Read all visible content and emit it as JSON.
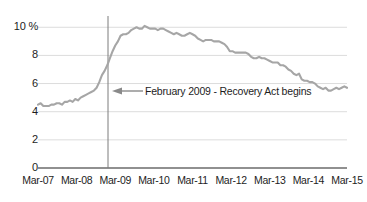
{
  "chart_data": {
    "type": "line",
    "title": "",
    "subtitle": "",
    "xlabel": "",
    "ylabel": "",
    "grid": true,
    "legend": "none",
    "ylim": [
      0,
      10.8
    ],
    "yticks": [
      0,
      2,
      4,
      6,
      8,
      10
    ],
    "ytick_labels": [
      "0",
      "2",
      "4",
      "6",
      "8",
      "10 %"
    ],
    "xtick_labels": [
      "Mar-07",
      "Mar-08",
      "Mar-09",
      "Mar-10",
      "Mar-11",
      "Mar-12",
      "Mar-13",
      "Mar-14",
      "Mar-15"
    ],
    "x_start": "Mar-07",
    "x_end": "Mar-15",
    "line_color": "#a6a6a6",
    "axis_color": "#6b6b6b",
    "grid_color": "#dcdcdc",
    "text_color": "#1d1d1d",
    "series": [
      {
        "name": "Unemployment rate",
        "values": [
          4.5,
          4.6,
          4.4,
          4.4,
          4.4,
          4.5,
          4.5,
          4.6,
          4.6,
          4.5,
          4.7,
          4.7,
          4.8,
          4.7,
          4.9,
          4.8,
          5.0,
          5.1,
          5.2,
          5.3,
          5.4,
          5.5,
          5.7,
          6.1,
          6.6,
          6.9,
          7.3,
          7.8,
          8.3,
          8.7,
          9.0,
          9.4,
          9.5,
          9.5,
          9.6,
          9.8,
          9.9,
          10.0,
          9.9,
          9.9,
          10.1,
          10.0,
          9.9,
          9.9,
          9.9,
          9.8,
          9.9,
          9.9,
          9.8,
          9.7,
          9.6,
          9.5,
          9.6,
          9.5,
          9.4,
          9.4,
          9.5,
          9.6,
          9.5,
          9.4,
          9.2,
          9.1,
          9.0,
          9.1,
          9.1,
          9.1,
          9.0,
          9.0,
          9.0,
          8.9,
          8.8,
          8.6,
          8.3,
          8.3,
          8.2,
          8.2,
          8.2,
          8.2,
          8.2,
          8.1,
          7.9,
          7.8,
          7.8,
          7.9,
          7.8,
          7.8,
          7.7,
          7.6,
          7.5,
          7.5,
          7.5,
          7.3,
          7.3,
          7.2,
          7.0,
          6.9,
          6.7,
          6.6,
          6.7,
          6.3,
          6.2,
          6.2,
          6.1,
          6.1,
          6.0,
          5.8,
          5.7,
          5.6,
          5.7,
          5.5,
          5.5,
          5.6,
          5.7,
          5.6,
          5.7,
          5.8,
          5.7
        ]
      }
    ],
    "annotations": [
      {
        "name": "recovery-act-marker",
        "text": "February 2009 - Recovery Act begins",
        "x_value": "Feb-09",
        "marker": "vertical-line",
        "arrow": "left"
      }
    ]
  }
}
